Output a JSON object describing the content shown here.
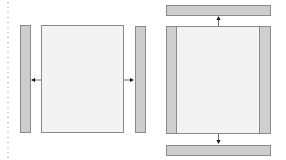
{
  "diagram": {
    "colors": {
      "panel_fill_gray": "#cdcdcd",
      "panel_fill_light": "#f3f3f3",
      "border": "#8a8a8a",
      "arrow": "#222222",
      "dotted_line": "#c8c8c8"
    },
    "left_layout": {
      "elements": [
        {
          "id": "left-sidebar",
          "x": 20,
          "y": 25,
          "w": 11,
          "h": 108,
          "fill": "gray"
        },
        {
          "id": "main-panel",
          "x": 41,
          "y": 25,
          "w": 83,
          "h": 108,
          "fill": "light"
        },
        {
          "id": "right-sidebar",
          "x": 135,
          "y": 26,
          "w": 11,
          "h": 107,
          "fill": "gray"
        }
      ],
      "arrows": [
        {
          "direction": "left",
          "from": [
            41,
            80
          ],
          "to": [
            31,
            80
          ]
        },
        {
          "direction": "right",
          "from": [
            124,
            80
          ],
          "to": [
            135,
            80
          ]
        }
      ]
    },
    "right_layout": {
      "elements": [
        {
          "id": "top-bar",
          "x": 166,
          "y": 5,
          "w": 105,
          "h": 11,
          "fill": "gray"
        },
        {
          "id": "main-panel",
          "x": 166,
          "y": 26,
          "w": 105,
          "h": 108,
          "fill": "light"
        },
        {
          "id": "left-strip",
          "x": 166,
          "y": 26,
          "w": 11,
          "h": 108,
          "fill": "gray"
        },
        {
          "id": "right-strip",
          "x": 260,
          "y": 26,
          "w": 11,
          "h": 108,
          "fill": "gray"
        },
        {
          "id": "bottom-bar",
          "x": 166,
          "y": 145,
          "w": 105,
          "h": 11,
          "fill": "gray"
        }
      ],
      "arrows": [
        {
          "direction": "up",
          "from": [
            218,
            26
          ],
          "to": [
            218,
            16
          ]
        },
        {
          "direction": "down",
          "from": [
            218,
            134
          ],
          "to": [
            218,
            145
          ]
        }
      ]
    }
  }
}
